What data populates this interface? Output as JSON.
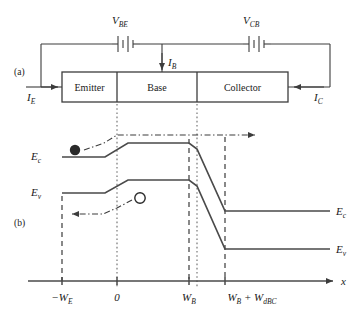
{
  "figure": {
    "panels": [
      {
        "tag": "(a)",
        "name": "circuit-panel"
      },
      {
        "tag": "(b)",
        "name": "band-diagram-panel"
      }
    ]
  },
  "circuit": {
    "sources": [
      {
        "name": "base-emitter-source",
        "symbol": "V",
        "subscript": "BE"
      },
      {
        "name": "collector-base-source",
        "symbol": "V",
        "subscript": "CB"
      }
    ],
    "currents": [
      {
        "name": "emitter-current",
        "symbol": "I",
        "subscript": "E",
        "direction": "right"
      },
      {
        "name": "base-current",
        "symbol": "I",
        "subscript": "B",
        "direction": "down"
      },
      {
        "name": "collector-current",
        "symbol": "I",
        "subscript": "C",
        "direction": "left"
      }
    ],
    "regions": [
      {
        "name": "emitter-region",
        "label": "Emitter"
      },
      {
        "name": "base-region",
        "label": "Base"
      },
      {
        "name": "collector-region",
        "label": "Collector"
      }
    ]
  },
  "band_diagram": {
    "band_labels": [
      {
        "name": "conduction-band-label-left",
        "symbol": "E",
        "subscript": "c"
      },
      {
        "name": "valence-band-label-left",
        "symbol": "E",
        "subscript": "v"
      },
      {
        "name": "conduction-band-label-right",
        "symbol": "E",
        "subscript": "c"
      },
      {
        "name": "valence-band-label-right",
        "symbol": "E",
        "subscript": "v"
      }
    ],
    "carriers": [
      {
        "name": "electron-marker",
        "type": "electron",
        "fill": "solid"
      },
      {
        "name": "hole-marker",
        "type": "hole",
        "fill": "open"
      }
    ],
    "axis": {
      "name": "x-axis",
      "label": "x",
      "ticks": [
        {
          "name": "tick-minus-we",
          "main": "−W",
          "subscript": "E"
        },
        {
          "name": "tick-zero",
          "main": "0",
          "subscript": ""
        },
        {
          "name": "tick-wb",
          "main": "W",
          "subscript": "B"
        },
        {
          "name": "tick-wb-plus-wdbc",
          "main": "W",
          "subscript": "B",
          "extra": " + W",
          "extra_subscript": "dBC"
        }
      ]
    }
  },
  "colors": {
    "ink": "#1a1a1a",
    "line": "#3c3c3c",
    "band": "#4a4a4a",
    "guide": "#6a6a6a",
    "background": "#ffffff"
  }
}
